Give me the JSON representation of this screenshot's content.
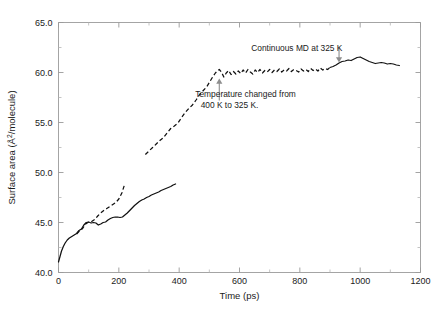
{
  "chart_data": {
    "type": "line",
    "title": "",
    "xlabel": "Time (ps)",
    "ylabel": "Surface area (Å²/molecule)",
    "xlim": [
      0,
      1200
    ],
    "ylim": [
      40.0,
      65.0
    ],
    "xticks": [
      0,
      200,
      400,
      600,
      800,
      1000,
      1200
    ],
    "xtick_labels": [
      "0",
      "200",
      "400",
      "600",
      "800",
      "1000",
      "1200"
    ],
    "yticks": [
      40.0,
      45.0,
      50.0,
      55.0,
      60.0,
      65.0
    ],
    "ytick_labels": [
      "40.0",
      "45.0",
      "50.0",
      "55.0",
      "60.0",
      "65.0"
    ],
    "x_minor_step": 100,
    "y_minor_step": 2.5,
    "grid": false,
    "legend": "none",
    "annotations": [
      {
        "id": "continuous-md",
        "text": "Continuous MD at 325 K",
        "text_x": 790,
        "text_y": 62.15,
        "arrow_from": [
          930,
          62.6
        ],
        "arrow_to": [
          930,
          61.0
        ],
        "arrow_direction": "down"
      },
      {
        "id": "temperature-change",
        "line1": "Temperature changed from",
        "line2": "400 K to 325 K.",
        "text_x": 620,
        "text_y": 57.6,
        "arrow_from": [
          533,
          57.2
        ],
        "arrow_to": [
          533,
          59.4
        ],
        "arrow_direction": "up"
      }
    ],
    "series": [
      {
        "name": "Lower solid branch (400 K growth)",
        "style": "solid",
        "x": [
          0,
          5,
          10,
          16,
          22,
          29,
          36,
          44,
          52,
          60,
          68,
          76,
          84,
          92,
          100,
          108,
          116,
          124,
          132,
          140,
          148,
          156,
          164,
          172,
          180,
          188,
          196,
          204,
          212,
          220,
          228,
          236,
          244,
          252,
          260,
          268,
          276,
          284,
          292,
          300,
          308,
          316,
          324,
          332,
          340,
          348,
          356,
          364,
          372,
          380,
          388
        ],
        "y": [
          41.05,
          41.6,
          42.15,
          42.6,
          42.95,
          43.25,
          43.45,
          43.6,
          43.75,
          43.9,
          44.2,
          44.35,
          44.75,
          45.0,
          45.05,
          44.95,
          45.0,
          44.95,
          44.75,
          44.85,
          45.0,
          45.05,
          45.25,
          45.4,
          45.5,
          45.55,
          45.55,
          45.5,
          45.55,
          45.75,
          45.95,
          46.2,
          46.45,
          46.7,
          46.9,
          47.1,
          47.25,
          47.35,
          47.5,
          47.6,
          47.75,
          47.85,
          47.95,
          48.05,
          48.2,
          48.3,
          48.4,
          48.5,
          48.6,
          48.75,
          48.85
        ]
      },
      {
        "name": "Early dashed branch (400 K)",
        "style": "dashed",
        "x": [
          60,
          70,
          80,
          90,
          100,
          110,
          120,
          130,
          140,
          150,
          160,
          170,
          180,
          190,
          200,
          210,
          218
        ],
        "y": [
          43.85,
          44.15,
          44.4,
          44.85,
          45.05,
          45.1,
          45.3,
          45.65,
          45.95,
          46.2,
          46.4,
          46.6,
          46.8,
          47.0,
          47.35,
          47.95,
          48.7
        ]
      },
      {
        "name": "Upper dashed branch (continued MD, 400 K → 325 K)",
        "style": "dashed",
        "x": [
          288,
          300,
          312,
          324,
          336,
          348,
          360,
          372,
          384,
          396,
          408,
          420,
          432,
          444,
          456,
          468,
          480,
          492,
          504,
          512,
          520,
          528,
          533,
          540,
          548,
          556,
          564,
          572,
          580,
          588,
          596,
          604,
          612,
          620,
          628,
          636,
          644,
          652,
          660,
          668,
          676,
          684,
          692,
          700,
          708,
          716,
          724,
          732,
          740,
          748,
          756,
          764,
          772,
          780,
          788,
          796,
          804,
          812,
          820,
          828,
          836,
          844,
          852,
          860,
          868,
          876,
          884,
          892,
          900
        ],
        "y": [
          51.8,
          52.15,
          52.5,
          52.85,
          53.2,
          53.5,
          53.95,
          54.4,
          54.65,
          54.95,
          55.5,
          56.0,
          56.4,
          56.75,
          57.25,
          57.8,
          58.2,
          58.6,
          59.2,
          59.6,
          59.95,
          60.2,
          60.3,
          60.05,
          59.55,
          59.95,
          60.2,
          59.8,
          60.1,
          59.85,
          60.15,
          59.9,
          60.25,
          59.95,
          60.3,
          60.05,
          59.85,
          60.25,
          60.0,
          60.3,
          59.95,
          60.2,
          60.05,
          60.3,
          60.0,
          60.25,
          60.1,
          60.35,
          60.05,
          60.25,
          60.15,
          60.4,
          60.1,
          60.3,
          60.2,
          60.05,
          60.35,
          60.15,
          60.3,
          60.1,
          60.4,
          60.2,
          60.35,
          60.15,
          60.45,
          60.25,
          60.4,
          60.3,
          60.5
        ]
      },
      {
        "name": "Final solid branch (325 K equilibrium)",
        "style": "solid",
        "x": [
          900,
          910,
          920,
          930,
          940,
          950,
          960,
          970,
          980,
          990,
          1000,
          1010,
          1020,
          1030,
          1040,
          1050,
          1060,
          1070,
          1080,
          1090,
          1100,
          1110,
          1120,
          1130
        ],
        "y": [
          60.5,
          60.6,
          60.75,
          60.95,
          61.1,
          61.15,
          61.25,
          61.2,
          61.35,
          61.5,
          61.55,
          61.4,
          61.25,
          61.1,
          61.0,
          60.9,
          60.95,
          61.0,
          60.95,
          60.85,
          60.9,
          60.85,
          60.75,
          60.7
        ]
      }
    ]
  }
}
